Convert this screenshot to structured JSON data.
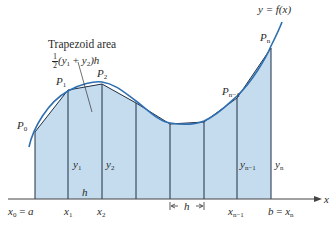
{
  "diagram": {
    "title_label": "Trapezoid area",
    "formula_label": "½(y₁ + y₂)h",
    "curve_label": "y = f(x)",
    "axis_label": "x",
    "colors": {
      "fill": "#c5dcef",
      "curve": "#2f6fb0",
      "lines": "#1f2f44",
      "text": "#2a2a2a"
    },
    "points": [
      {
        "name": "P0",
        "x": 35,
        "y": 132
      },
      {
        "name": "P1",
        "x": 68,
        "y": 90
      },
      {
        "name": "P2",
        "x": 102,
        "y": 84
      },
      {
        "name": "P3",
        "x": 136,
        "y": 103
      },
      {
        "name": "P4",
        "x": 170,
        "y": 124
      },
      {
        "name": "P5",
        "x": 204,
        "y": 122
      },
      {
        "name": "Pn-1",
        "x": 237,
        "y": 98
      },
      {
        "name": "Pn",
        "x": 271,
        "y": 48
      }
    ],
    "point_labels": [
      "P0",
      "P1",
      "P2",
      "Pn−1",
      "Pn"
    ],
    "x_tick_labels": [
      "x0 = a",
      "x1",
      "x2",
      "xn−1",
      "b = xn"
    ],
    "y_labels": [
      "y1",
      "y2",
      "yn−1",
      "yn"
    ],
    "h_labels": [
      "h",
      "← h →"
    ]
  }
}
